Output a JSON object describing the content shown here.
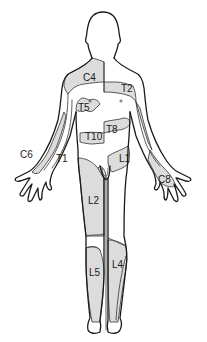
{
  "diagram": {
    "type": "dermatome-map",
    "view": "anterior",
    "colors": {
      "outline": "#1a1a1a",
      "shade": "#d9d9d9",
      "background": "#ffffff"
    },
    "labels": {
      "c4": "C4",
      "t2": "T2",
      "t5": "T5",
      "t8": "T8",
      "t10": "T10",
      "l1": "L1",
      "c6": "C6",
      "t1": "T1",
      "c8": "C8",
      "l2": "L2",
      "l4": "L4",
      "l5": "L5"
    }
  }
}
